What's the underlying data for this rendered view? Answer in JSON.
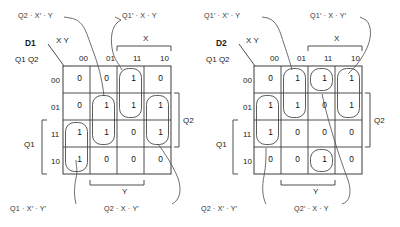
{
  "figure": {
    "name": "karnaugh-map-pair",
    "background": "#ffffff",
    "line_color": "#3a3a3a",
    "text_color": "#2b2b2b"
  },
  "maps": [
    {
      "id": "d1",
      "title": "D1",
      "axis_top_label": "X Y",
      "axis_left_label": "Q1 Q2",
      "col_headers": [
        "00",
        "01",
        "11",
        "10"
      ],
      "row_headers": [
        "00",
        "01",
        "11",
        "10"
      ],
      "grid": [
        [
          "0",
          "0",
          "1",
          "0"
        ],
        [
          "0",
          "1",
          "1",
          "1"
        ],
        [
          "1",
          "1",
          "0",
          "1"
        ],
        [
          "1",
          "0",
          "0",
          "0"
        ]
      ],
      "brackets": {
        "top": "X",
        "bottom": "Y",
        "left": "Q1",
        "right": "Q2"
      },
      "annotations": [
        {
          "text": "Q2 · X′ · Y",
          "position": "top-left"
        },
        {
          "text": "Q1′ · X · Y",
          "position": "top-right"
        },
        {
          "text": "Q1 · X′ · Y′",
          "position": "bottom-left"
        },
        {
          "text": "Q2 · X · Y′",
          "position": "bottom-right"
        }
      ]
    },
    {
      "id": "d2",
      "title": "D2",
      "axis_top_label": "X Y",
      "axis_left_label": "Q1 Q2",
      "col_headers": [
        "00",
        "01",
        "11",
        "10"
      ],
      "row_headers": [
        "00",
        "01",
        "11",
        "10"
      ],
      "grid": [
        [
          "0",
          "1",
          "1",
          "1"
        ],
        [
          "1",
          "1",
          "0",
          "1"
        ],
        [
          "1",
          "0",
          "0",
          "0"
        ],
        [
          "0",
          "0",
          "1",
          "0"
        ]
      ],
      "brackets": {
        "top": "X",
        "bottom": "Y",
        "left": "Q1",
        "right": "Q2"
      },
      "annotations": [
        {
          "text": "Q1′ · X′ · Y",
          "position": "top-left"
        },
        {
          "text": "Q1′ · X · Y′",
          "position": "top-right"
        },
        {
          "text": "Q2 · X′ · Y′",
          "position": "bottom-left"
        },
        {
          "text": "Q2′ · X · Y",
          "position": "bottom-right"
        }
      ]
    }
  ]
}
